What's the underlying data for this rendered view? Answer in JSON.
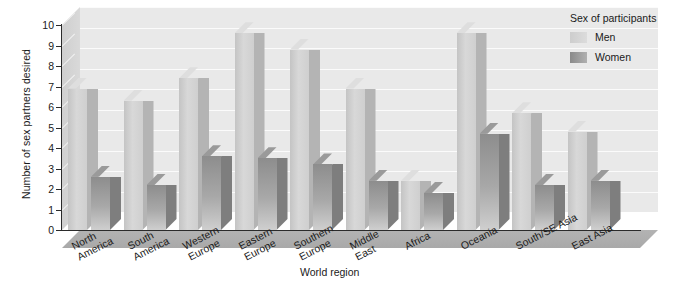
{
  "chart_data": {
    "type": "bar",
    "title": "",
    "xlabel": "World region",
    "ylabel": "Number of sex partners desired",
    "ylim": [
      0,
      10
    ],
    "ytick_labels": [
      "0",
      "1",
      "2",
      "3",
      "4",
      "5",
      "6",
      "7",
      "8",
      "9",
      "10"
    ],
    "grid": true,
    "legend_position": "top-right",
    "legend_title": "Sex of participants",
    "categories": [
      "North America",
      "South America",
      "Western Europe",
      "Eastern Europe",
      "Southern Europe",
      "Middle East",
      "Africa",
      "Oceania",
      "South/SE Asia",
      "East Asia"
    ],
    "category_lines": [
      [
        "North",
        "America"
      ],
      [
        "South",
        "America"
      ],
      [
        "Western",
        "Europe"
      ],
      [
        "Eastern",
        "Europe"
      ],
      [
        "Southern",
        "Europe"
      ],
      [
        "Middle",
        "East"
      ],
      [
        "Africa"
      ],
      [
        "Oceania"
      ],
      [
        "South/SE Asia"
      ],
      [
        "East Asia"
      ]
    ],
    "series": [
      {
        "name": "Men",
        "color": "#d4d4d4",
        "values": [
          6.9,
          6.3,
          7.4,
          9.6,
          8.8,
          6.9,
          2.4,
          9.6,
          5.7,
          4.8
        ]
      },
      {
        "name": "Women",
        "color": "#9a9a9a",
        "values": [
          2.6,
          2.2,
          3.6,
          3.5,
          3.2,
          2.4,
          1.8,
          4.7,
          2.2,
          2.4
        ]
      }
    ]
  },
  "colors": {
    "plot_background": "#e9e9e9",
    "floor": "#b0b0b0",
    "gridline": "#fbfbfb",
    "axis": "#2b2b2b",
    "men": "#d4d4d4",
    "women": "#9a9a9a"
  }
}
